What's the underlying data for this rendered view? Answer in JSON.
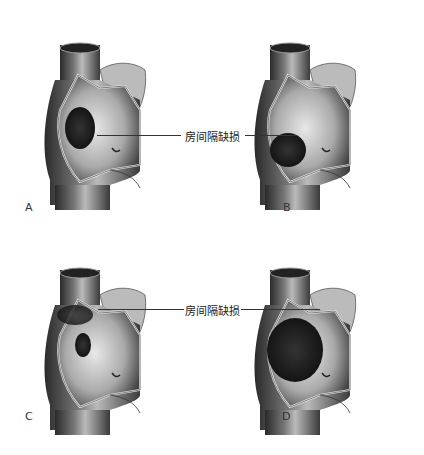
{
  "figure": {
    "callout_label": "房间隔缺损",
    "panels": [
      {
        "letter": "A",
        "defect": "small oval defect in mid septum"
      },
      {
        "letter": "B",
        "defect": "defect in lower septum"
      },
      {
        "letter": "C",
        "defect": "defect in upper septum near SVC"
      },
      {
        "letter": "D",
        "defect": "large defect"
      }
    ]
  }
}
